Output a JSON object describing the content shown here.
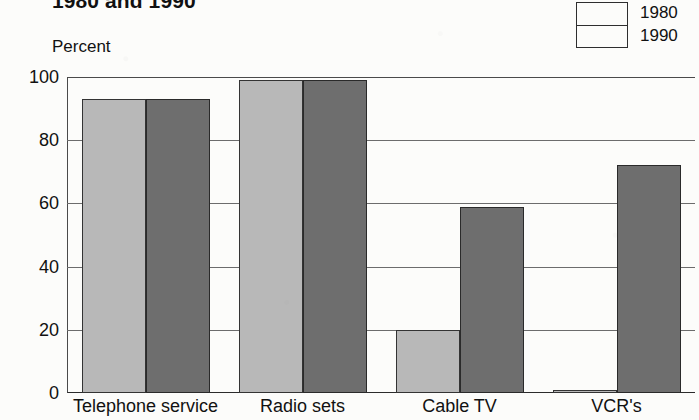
{
  "chart_data": {
    "type": "bar",
    "title": "1980 and 1990",
    "xlabel": "",
    "ylabel": "Percent",
    "ylim": [
      0,
      100
    ],
    "yticks": [
      0,
      20,
      40,
      60,
      80,
      100
    ],
    "ytick_labels": [
      "0",
      "20",
      "40",
      "60",
      "80",
      "100"
    ],
    "grid": true,
    "legend_position": "top-right",
    "categories": [
      "Telephone service",
      "Radio sets",
      "Cable TV",
      "VCR's"
    ],
    "series": [
      {
        "name": "1980",
        "color": "#b8b8b8",
        "values": [
          93,
          99,
          20,
          1
        ]
      },
      {
        "name": "1990",
        "color": "#6e6e6e",
        "values": [
          93,
          99,
          59,
          72
        ]
      }
    ]
  },
  "legend": {
    "entries": [
      {
        "label": "1980",
        "color": "#b8b8b8"
      },
      {
        "label": "1990",
        "color": "#6e6e6e"
      }
    ]
  },
  "axis": {
    "unit_label": "Percent"
  }
}
